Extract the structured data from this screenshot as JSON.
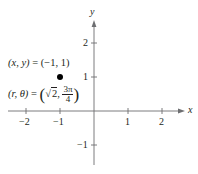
{
  "diagram": {
    "type": "cartesian-plane-with-point",
    "axes": {
      "x_label": "x",
      "y_label": "y",
      "x_ticks": [
        {
          "value": -2,
          "label": "−2"
        },
        {
          "value": -1,
          "label": "−1"
        },
        {
          "value": 1,
          "label": "1"
        },
        {
          "value": 2,
          "label": "2"
        }
      ],
      "y_ticks": [
        {
          "value": 2,
          "label": "2"
        },
        {
          "value": 1,
          "label": "1"
        },
        {
          "value": -1,
          "label": "−1"
        }
      ]
    },
    "point": {
      "x": -1,
      "y": 1,
      "rect_label_lhs": "(x, y)",
      "rect_label_rhs": "= (−1, 1)",
      "polar_label_lhs": "(r, θ)",
      "polar_label_eq": "=",
      "polar_r": "2",
      "polar_theta_num": "3π",
      "polar_theta_den": "4"
    },
    "colors": {
      "ink": "#231f20",
      "axis": "#6d6e71",
      "point": "#000000"
    }
  }
}
